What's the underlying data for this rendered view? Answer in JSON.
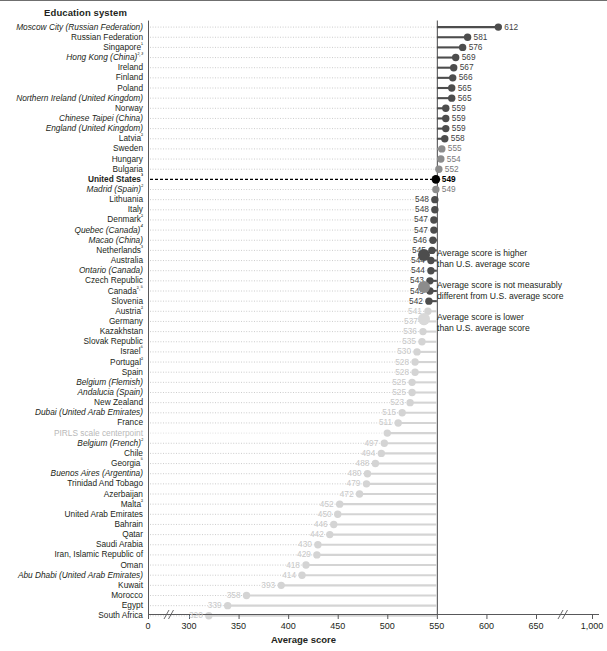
{
  "header": {
    "column_title": "Education system"
  },
  "axis": {
    "title": "Average score",
    "ticks": [
      "0",
      "300",
      "350",
      "400",
      "450",
      "500",
      "550",
      "600",
      "650",
      "1,000"
    ],
    "has_break_low": true,
    "has_break_high": true,
    "reference_line_value": 550
  },
  "legend": {
    "items": [
      {
        "color": "#4d4d4d",
        "line1": "Average score is higher",
        "line2": "than U.S. average score"
      },
      {
        "color": "#8c8c8c",
        "line1": "Average score is not measurably",
        "line2": "different from U.S. average score"
      },
      {
        "color": "#d9d9d9",
        "line1": "Average score is lower",
        "line2": "than U.S. average score"
      }
    ]
  },
  "colors": {
    "higher": "#4d4d4d",
    "same": "#8c8c8c",
    "lower": "#d4d4d4",
    "us": "#000000",
    "centerpoint_text": "#b9b9b9"
  },
  "chart_data": {
    "type": "bar",
    "title": "Education system",
    "xlabel": "Average score",
    "ylabel": "Education system",
    "xlim": [
      300,
      650
    ],
    "grid": true,
    "reference_line": 550,
    "categories": [
      "Moscow City (Russian Federation)",
      "Russian Federation",
      "Singapore¹",
      "Hong Kong (China)²,³",
      "Ireland",
      "Finland",
      "Poland",
      "Northern Ireland (United Kingdom)",
      "Norway",
      "Chinese Taipei (China)",
      "England (United Kingdom)",
      "Latvia²",
      "Sweden",
      "Hungary",
      "Bulgaria",
      "United States³",
      "Madrid (Spain)²",
      "Lithuania",
      "Italy",
      "Denmark²",
      "Quebec (Canada)⁴",
      "Macao (China)",
      "Netherlands³",
      "Australia",
      "Ontario (Canada)",
      "Czech Republic",
      "Canada²,⁵",
      "Slovenia",
      "Austria²",
      "Germany",
      "Kazakhstan",
      "Slovak Republic",
      "Israel⁶",
      "Portugal²",
      "Spain",
      "Belgium (Flemish)",
      "Andalucia (Spain)",
      "New Zealand",
      "Dubai (United Arab Emirates)",
      "France",
      "PIRLS scale centerpoint",
      "Belgium (French)²",
      "Chile",
      "Georgia⁵",
      "Buenos Aires (Argentina)",
      "Trinidad And Tobago",
      "Azerbaijan",
      "Malta²",
      "United Arab Emirates",
      "Bahrain",
      "Qatar",
      "Saudi Arabia",
      "Iran, Islamic Republic of",
      "Oman",
      "Abu Dhabi (United Arab Emirates)",
      "Kuwait",
      "Morocco",
      "Egypt",
      "South Africa"
    ],
    "values": [
      612,
      581,
      576,
      569,
      567,
      566,
      565,
      565,
      559,
      559,
      559,
      558,
      555,
      554,
      552,
      549,
      549,
      548,
      548,
      547,
      547,
      546,
      545,
      544,
      544,
      543,
      543,
      542,
      541,
      537,
      536,
      535,
      530,
      528,
      528,
      525,
      525,
      523,
      515,
      511,
      500,
      497,
      494,
      488,
      480,
      479,
      472,
      452,
      450,
      446,
      442,
      430,
      429,
      418,
      414,
      393,
      358,
      339,
      320
    ],
    "significance": [
      "higher",
      "higher",
      "higher",
      "higher",
      "higher",
      "higher",
      "higher",
      "higher",
      "higher",
      "higher",
      "higher",
      "higher",
      "same",
      "same",
      "same",
      "us",
      "same",
      "higher",
      "higher",
      "higher",
      "higher",
      "higher",
      "higher",
      "higher",
      "higher",
      "higher",
      "higher",
      "higher",
      "lower",
      "lower",
      "lower",
      "lower",
      "lower",
      "lower",
      "lower",
      "lower",
      "lower",
      "lower",
      "lower",
      "lower",
      "centerpoint",
      "lower",
      "lower",
      "lower",
      "lower",
      "lower",
      "lower",
      "lower",
      "lower",
      "lower",
      "lower",
      "lower",
      "lower",
      "lower",
      "lower",
      "lower",
      "lower",
      "lower",
      "lower"
    ],
    "italic_labels": [
      "Moscow City (Russian Federation)",
      "Hong Kong (China)²,³",
      "Northern Ireland (United Kingdom)",
      "Chinese Taipei (China)",
      "England (United Kingdom)",
      "Madrid (Spain)²",
      "Quebec (Canada)⁴",
      "Macao (China)",
      "Ontario (Canada)",
      "Belgium (Flemish)",
      "Andalucia (Spain)",
      "Dubai (United Arab Emirates)",
      "Belgium (French)²",
      "Buenos Aires (Argentina)",
      "Abu Dhabi (United Arab Emirates)"
    ]
  }
}
